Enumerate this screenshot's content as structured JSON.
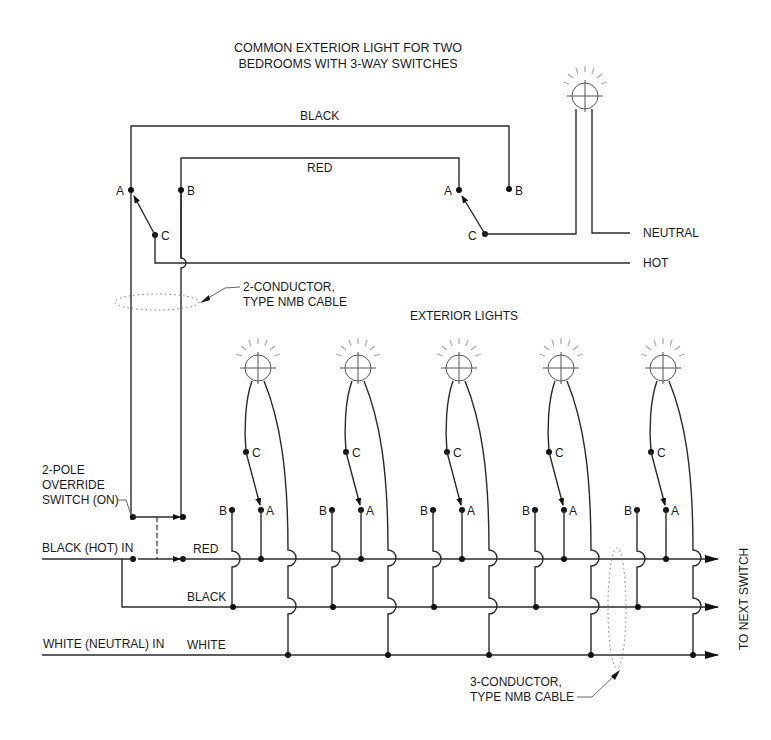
{
  "title": {
    "line1": "COMMON EXTERIOR LIGHT FOR TWO",
    "line2": "BEDROOMS WITH 3-WAY SWITCHES"
  },
  "top_circuit": {
    "wire_black": "BLACK",
    "wire_red": "RED",
    "neutral": "NEUTRAL",
    "hot": "HOT",
    "switch1": {
      "a": "A",
      "b": "B",
      "c": "C"
    },
    "switch2": {
      "a": "A",
      "b": "B",
      "c": "C"
    }
  },
  "cable_2": {
    "line1": "2-CONDUCTOR,",
    "line2": "TYPE NMB CABLE"
  },
  "exterior_lights": {
    "heading": "EXTERIOR LIGHTS",
    "count": 5,
    "terminals": {
      "a": "A",
      "b": "B",
      "c": "C"
    }
  },
  "override_switch": {
    "line1": "2-POLE",
    "line2": "OVERRIDE",
    "line3": "SWITCH (ON)"
  },
  "bus": {
    "black_hot_in": "BLACK (HOT) IN",
    "red": "RED",
    "black": "BLACK",
    "white_neutral_in": "WHITE (NEUTRAL) IN",
    "white": "WHITE",
    "to_next_switch": "TO NEXT SWITCH"
  },
  "cable_3": {
    "line1": "3-CONDUCTOR,",
    "line2": "TYPE NMB CABLE"
  }
}
